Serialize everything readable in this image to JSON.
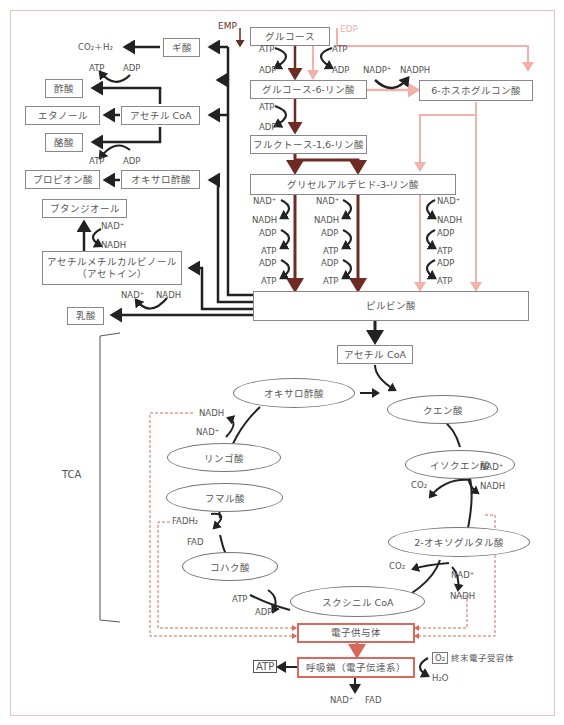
{
  "frame_color": "#e8c4c0",
  "colors": {
    "emp": "#6e2b24",
    "edp": "#f2b1a9",
    "main": "#222222",
    "electron": "#d6685c"
  },
  "pathway_labels": {
    "emp": "EMP",
    "edp": "EDP",
    "tca": "TCA"
  },
  "glycolysis": {
    "glucose": "グルコース",
    "g6p": "グルコース-6-リン酸",
    "pg6": "6-ホスホグルコン酸",
    "f16bp": "フルクトース-1,6-リン酸",
    "gap": "グリセルアルデヒド-3-リン酸",
    "pyruvate": "ピルビン酸",
    "cofactors": {
      "atp": "ATP",
      "adp": "ADP",
      "nad": "NAD⁺",
      "nadh": "NADH",
      "nadp": "NADP⁺",
      "nadph": "NADPH"
    }
  },
  "fermentation": {
    "formate": "ギ酸",
    "co2_h2": "CO₂＋H₂",
    "acetate": "酢酸",
    "acetyl_coa": "アセチル CoA",
    "ethanol": "エタノール",
    "butyrate": "酪酸",
    "propionate": "プロピオン酸",
    "oxaloacetate": "オキサロ酢酸",
    "butanediol": "ブタンジオール",
    "acetoin_line1": "アセチルメチルカルビノール",
    "acetoin_line2": "（アセトイン）",
    "lactate": "乳酸"
  },
  "tca": {
    "acetyl_coa": "アセチル CoA",
    "oxaloacetate": "オキサロ酢酸",
    "citrate": "クエン酸",
    "isocitrate": "イソクエン酸",
    "oxoglutarate": "2-オキソグルタル酸",
    "succinyl_coa": "スクシニル CoA",
    "succinate": "コハク酸",
    "fumarate": "フマル酸",
    "malate": "リンゴ酸",
    "co2": "CO₂",
    "fadh2": "FADH₂",
    "fad": "FAD"
  },
  "electron": {
    "donor": "電子供与体",
    "chain": "呼吸鎖（電子伝達系）",
    "atp": "ATP",
    "o2": "O₂",
    "acceptor": "終末電子受容体",
    "h2o": "H₂O",
    "nad": "NAD⁺",
    "fad": "FAD"
  }
}
